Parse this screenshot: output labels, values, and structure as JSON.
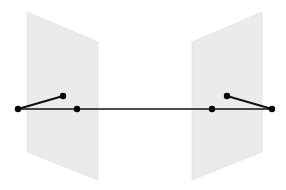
{
  "diagram": {
    "type": "stereo-epipolar-geometry",
    "width": 286,
    "height": 190,
    "colors": {
      "background": "#ffffff",
      "plane_fill": "#ebebeb",
      "plane_edge": "#dddddd",
      "line": "#111111",
      "line_behind_plane": "#555555",
      "point": "#000000"
    },
    "planes": [
      {
        "name": "left-image-plane",
        "points": "27,12 98,42 98,180 27,152"
      },
      {
        "name": "right-image-plane",
        "points": "192,42 262,12 262,152 192,180"
      }
    ],
    "baseline": {
      "x1": 18,
      "y1": 109,
      "x2": 272,
      "y2": 109
    },
    "segments": [
      {
        "name": "left-ray-segment",
        "x1": 18,
        "y1": 109,
        "x2": 63,
        "y2": 96
      },
      {
        "name": "right-ray-segment",
        "x1": 227,
        "y1": 96,
        "x2": 272,
        "y2": 109
      }
    ],
    "points": [
      {
        "name": "left-camera-center",
        "cx": 18,
        "cy": 109
      },
      {
        "name": "left-image-point",
        "cx": 63,
        "cy": 96
      },
      {
        "name": "left-epipole",
        "cx": 77,
        "cy": 109
      },
      {
        "name": "right-epipole",
        "cx": 212,
        "cy": 109
      },
      {
        "name": "right-image-point",
        "cx": 227,
        "cy": 96
      },
      {
        "name": "right-camera-center",
        "cx": 272,
        "cy": 109
      }
    ],
    "point_radius": 3.2,
    "line_width": 1.6
  }
}
